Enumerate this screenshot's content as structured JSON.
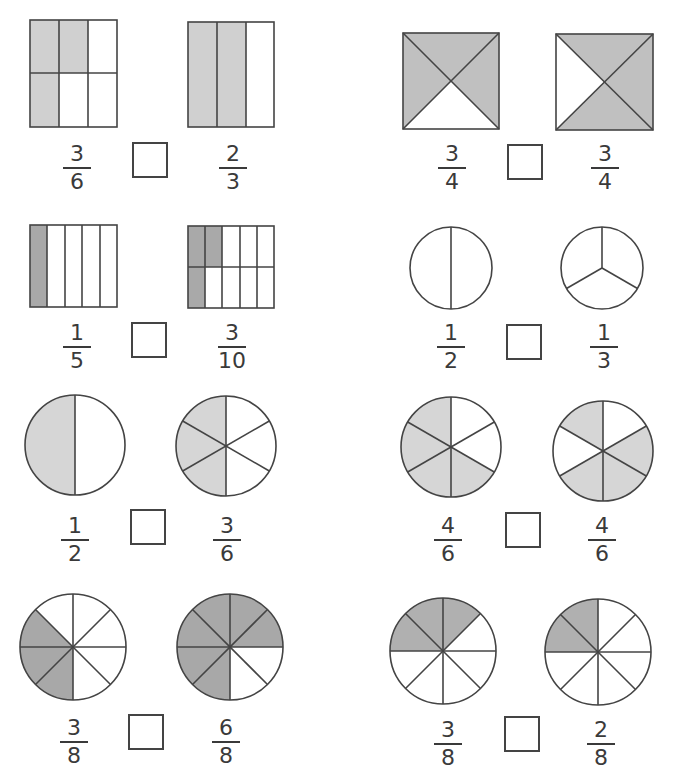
{
  "worksheet": {
    "shade_light": "#d6d6d6",
    "shade_medium": "#c2c2c2",
    "shade_dark": "#a8a8a8",
    "stroke": "#444444",
    "problems": [
      {
        "id": 1,
        "left": {
          "shape": "rect-2x3",
          "num": "3",
          "den": "6",
          "shaded": 3,
          "parts": 6
        },
        "right": {
          "shape": "rect-1x3",
          "num": "2",
          "den": "3",
          "shaded": 2,
          "parts": 3
        }
      },
      {
        "id": 2,
        "left": {
          "shape": "square-4-triangles",
          "num": "3",
          "den": "4",
          "shaded": 3,
          "parts": 4
        },
        "right": {
          "shape": "square-4-triangles",
          "num": "3",
          "den": "4",
          "shaded": 3,
          "parts": 4
        }
      },
      {
        "id": 3,
        "left": {
          "shape": "rect-1x5",
          "num": "1",
          "den": "5",
          "shaded": 1,
          "parts": 5
        },
        "right": {
          "shape": "rect-2x5",
          "num": "3",
          "den": "10",
          "shaded": 3,
          "parts": 10
        }
      },
      {
        "id": 4,
        "left": {
          "shape": "circle-2",
          "num": "1",
          "den": "2",
          "shaded": 0,
          "parts": 2
        },
        "right": {
          "shape": "circle-3",
          "num": "1",
          "den": "3",
          "shaded": 0,
          "parts": 3
        }
      },
      {
        "id": 5,
        "left": {
          "shape": "circle-2",
          "num": "1",
          "den": "2",
          "shaded": 1,
          "parts": 2
        },
        "right": {
          "shape": "circle-6",
          "num": "3",
          "den": "6",
          "shaded": 3,
          "parts": 6
        }
      },
      {
        "id": 6,
        "left": {
          "shape": "circle-6",
          "num": "4",
          "den": "6",
          "shaded": 4,
          "parts": 6
        },
        "right": {
          "shape": "circle-6",
          "num": "4",
          "den": "6",
          "shaded": 4,
          "parts": 6
        }
      },
      {
        "id": 7,
        "left": {
          "shape": "circle-8",
          "num": "3",
          "den": "8",
          "shaded": 3,
          "parts": 8
        },
        "right": {
          "shape": "circle-8",
          "num": "6",
          "den": "8",
          "shaded": 6,
          "parts": 8
        }
      },
      {
        "id": 8,
        "left": {
          "shape": "circle-8",
          "num": "3",
          "den": "8",
          "shaded": 3,
          "parts": 8
        },
        "right": {
          "shape": "circle-8",
          "num": "2",
          "den": "8",
          "shaded": 2,
          "parts": 8
        }
      }
    ],
    "answer_boxes": [
      "",
      "",
      "",
      "",
      "",
      "",
      "",
      ""
    ]
  }
}
